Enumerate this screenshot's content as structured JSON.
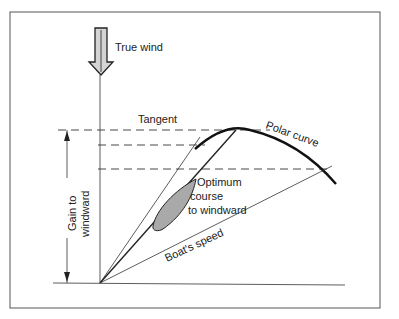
{
  "diagram": {
    "labels": {
      "true_wind": "True wind",
      "tangent": "Tangent",
      "polar_curve": "Polar curve",
      "gain_line1": "Gain to",
      "gain_line2": "windward",
      "optimum_line1": "Optimum",
      "optimum_line2": "course",
      "optimum_line3": "to windward",
      "boat_speed": "Boat's speed"
    },
    "colors": {
      "line": "#222222",
      "boat_fill": "#a9a9a9",
      "arrow_fill": "#cfcfcf",
      "frame": "#555555"
    }
  }
}
